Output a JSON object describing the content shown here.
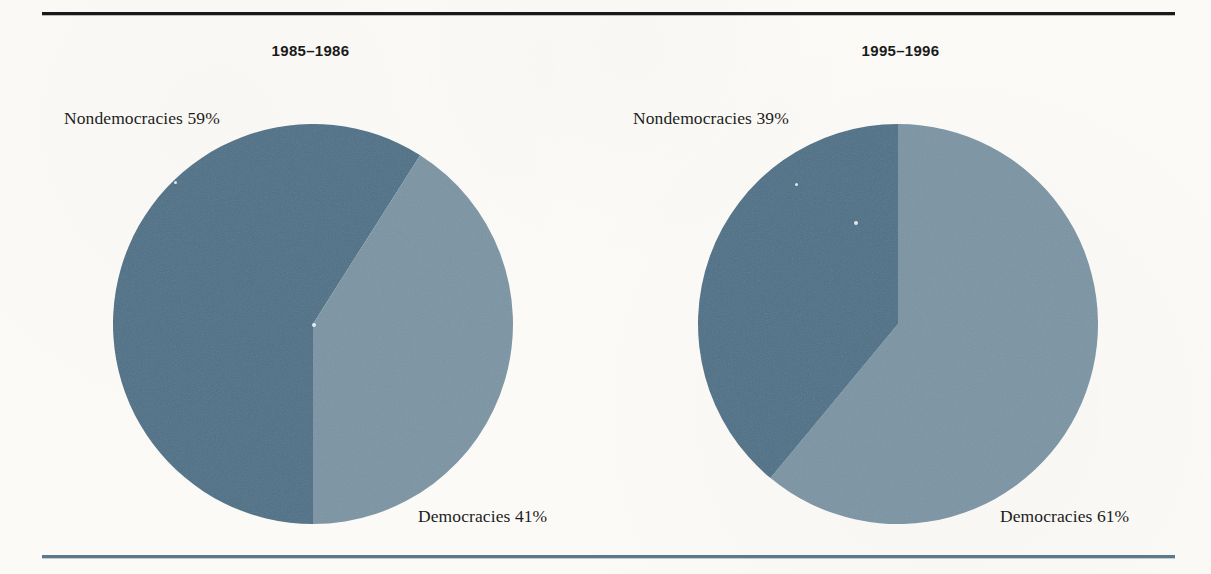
{
  "figure": {
    "background_color": "#fbfaf6",
    "top_rule_color": "#191919",
    "bottom_rule_color": "#5c798b"
  },
  "colors": {
    "nondemocracies": "#4d7087",
    "democracies": "#7b94a4"
  },
  "panels": [
    {
      "id": "left",
      "title": "1985–1986",
      "nondemocracies_label": "Nondemocracies 59%",
      "democracies_label": "Democracies 41%"
    },
    {
      "id": "right",
      "title": "1995–1996",
      "nondemocracies_label": "Nondemocracies 39%",
      "democracies_label": "Democracies 61%"
    }
  ],
  "chart_data": [
    {
      "type": "pie",
      "title": "1985–1986",
      "labels": [
        "Nondemocracies",
        "Democracies"
      ],
      "values": [
        59,
        41
      ],
      "value_unit": "percent",
      "data_labels": [
        "Nondemocracies 59%",
        "Democracies 41%"
      ],
      "colors": [
        "#4d7087",
        "#7b94a4"
      ],
      "start_angle_deg": 180,
      "direction": "clockwise",
      "legend": "none",
      "grid": false
    },
    {
      "type": "pie",
      "title": "1995–1996",
      "labels": [
        "Democracies",
        "Nondemocracies"
      ],
      "values": [
        61,
        39
      ],
      "value_unit": "percent",
      "data_labels": [
        "Democracies 61%",
        "Nondemocracies 39%"
      ],
      "colors": [
        "#7b94a4",
        "#4d7087"
      ],
      "start_angle_deg": 0,
      "direction": "clockwise",
      "legend": "none",
      "grid": false
    }
  ]
}
